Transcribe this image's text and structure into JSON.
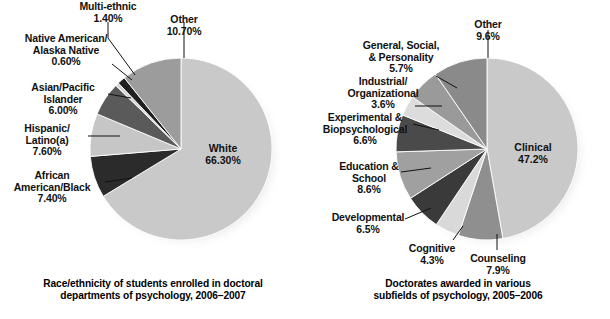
{
  "figure": {
    "background": "#ffffff",
    "text_color": "#111111"
  },
  "charts": [
    {
      "id": "race-ethnicity-doctoral-psychology",
      "caption": "Race/ethnicity of students enrolled in doctoral\ndepartments of psychology, 2006–2007",
      "center": {
        "x": 181,
        "y": 149
      },
      "radius": 91
    },
    {
      "id": "doctorates-subfields-psychology",
      "caption": "Doctorates awarded in various\nsubfields of psychology, 2005–2006",
      "center": {
        "x": 182,
        "y": 149
      },
      "radius": 91
    }
  ],
  "chart_data": [
    {
      "type": "pie",
      "title": "Race/ethnicity of students enrolled in doctoral departments of psychology, 2006–2007",
      "xlabel": "",
      "ylabel": "",
      "units": "percent",
      "legend": "none (direct labels with leader lines)",
      "grid": false,
      "start_angle_deg": 0,
      "direction": "clockwise",
      "categories": [
        "White",
        "African American/Black",
        "Hispanic/Latino(a)",
        "Asian/Pacific Islander",
        "Native American/Alaska Native",
        "Multi-ethnic",
        "Other"
      ],
      "values": [
        66.3,
        7.4,
        7.6,
        6.0,
        0.6,
        1.4,
        10.7
      ],
      "value_labels": [
        "66.30%",
        "7.40%",
        "7.60%",
        "6.00%",
        "0.60%",
        "1.40%",
        "10.70%"
      ],
      "colors": [
        "#c9c9c9",
        "#2b2b2b",
        "#c6c6c6",
        "#5a5a5a",
        "#d7d7d7",
        "#1f1f1f",
        "#9c9c9c"
      ],
      "slices": [
        {
          "label": "White",
          "value": 66.3,
          "value_text": "66.30%",
          "color": "#c9c9c9",
          "label_inside": true
        },
        {
          "label": "African American/Black",
          "value": 7.4,
          "value_text": "7.40%",
          "color": "#2b2b2b",
          "label_inside": false
        },
        {
          "label": "Hispanic/Latino(a)",
          "value": 7.6,
          "value_text": "7.60%",
          "color": "#c6c6c6",
          "label_inside": false
        },
        {
          "label": "Asian/Pacific Islander",
          "value": 6.0,
          "value_text": "6.00%",
          "color": "#5a5a5a",
          "label_inside": false
        },
        {
          "label": "Native American/Alaska Native",
          "value": 0.6,
          "value_text": "0.60%",
          "color": "#d7d7d7",
          "label_inside": false
        },
        {
          "label": "Multi-ethnic",
          "value": 1.4,
          "value_text": "1.40%",
          "color": "#1f1f1f",
          "label_inside": false
        },
        {
          "label": "Other",
          "value": 10.7,
          "value_text": "10.70%",
          "color": "#9c9c9c",
          "label_inside": false
        }
      ]
    },
    {
      "type": "pie",
      "title": "Doctorates awarded in various subfields of psychology, 2005–2006",
      "xlabel": "",
      "ylabel": "",
      "units": "percent",
      "legend": "none (direct labels with leader lines)",
      "grid": false,
      "start_angle_deg": 0,
      "direction": "clockwise",
      "categories": [
        "Clinical",
        "Counseling",
        "Cognitive",
        "Developmental",
        "Education & School",
        "Experimental & Biopsychological",
        "Industrial/Organizational",
        "General, Social, & Personality",
        "Other"
      ],
      "values": [
        47.2,
        7.9,
        4.3,
        6.5,
        8.6,
        6.6,
        3.6,
        5.7,
        9.6
      ],
      "value_labels": [
        "47.2%",
        "7.9%",
        "4.3%",
        "6.5%",
        "8.6%",
        "6.6%",
        "3.6%",
        "5.7%",
        "9.6%"
      ],
      "colors": [
        "#c9c9c9",
        "#8f8f8f",
        "#d9d9d9",
        "#3a3a3a",
        "#a0a0a0",
        "#4a4a4a",
        "#dcdcdc",
        "#9a9a9a",
        "#8a8a8a"
      ],
      "slices": [
        {
          "label": "Clinical",
          "value": 47.2,
          "value_text": "47.2%",
          "color": "#c9c9c9",
          "label_inside": true
        },
        {
          "label": "Counseling",
          "value": 7.9,
          "value_text": "7.9%",
          "color": "#8f8f8f",
          "label_inside": false
        },
        {
          "label": "Cognitive",
          "value": 4.3,
          "value_text": "4.3%",
          "color": "#d9d9d9",
          "label_inside": false
        },
        {
          "label": "Developmental",
          "value": 6.5,
          "value_text": "6.5%",
          "color": "#3a3a3a",
          "label_inside": false
        },
        {
          "label": "Education & School",
          "value": 8.6,
          "value_text": "8.6%",
          "color": "#a0a0a0",
          "label_inside": false
        },
        {
          "label": "Experimental & Biopsychological",
          "value": 6.6,
          "value_text": "6.6%",
          "color": "#4a4a4a",
          "label_inside": false
        },
        {
          "label": "Industrial/Organizational",
          "value": 3.6,
          "value_text": "3.6%",
          "color": "#dcdcdc",
          "label_inside": false
        },
        {
          "label": "General, Social, & Personality",
          "value": 5.7,
          "value_text": "5.7%",
          "color": "#9a9a9a",
          "label_inside": false
        },
        {
          "label": "Other",
          "value": 9.6,
          "value_text": "9.6%",
          "color": "#8a8a8a",
          "label_inside": false
        }
      ]
    }
  ],
  "left": {
    "caption": "Race/ethnicity of students enrolled in doctoral\ndepartments of psychology, 2006–2007",
    "labels": {
      "white": "White\n66.30%",
      "other": "Other\n10.70%",
      "multi_ethnic": "Multi-ethnic\n1.40%",
      "native_american": "Native American/\nAlaska Native\n0.60%",
      "asian_pacific": "Asian/Pacific\nIslander\n6.00%",
      "hispanic_latino": "Hispanic/\nLatino(a)\n7.60%",
      "african_american": "African\nAmerican/Black\n7.40%"
    }
  },
  "right": {
    "caption": "Doctorates awarded in various\nsubfields of psychology, 2005–2006",
    "labels": {
      "clinical": "Clinical\n47.2%",
      "other": "Other\n9.6%",
      "general_social_personality": "General, Social,\n& Personality\n5.7%",
      "industrial_organizational": "Industrial/\nOrganizational\n3.6%",
      "experimental_biopsych": "Experimental &\nBiopsychological\n6.6%",
      "education_school": "Education &\nSchool\n8.6%",
      "developmental": "Developmental\n6.5%",
      "cognitive": "Cognitive\n4.3%",
      "counseling": "Counseling\n7.9%"
    }
  }
}
